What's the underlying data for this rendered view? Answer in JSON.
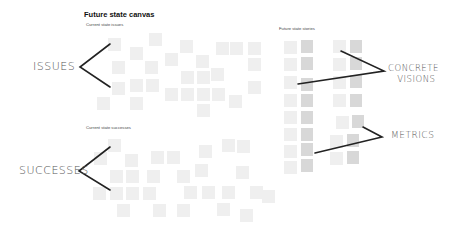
{
  "canvas": {
    "title": "Future state canvas",
    "sections": {
      "issues": {
        "label": "Current state issues"
      },
      "successes": {
        "label": "Current state successes"
      },
      "stories": {
        "label": "Future state stories"
      }
    },
    "annotations": {
      "issues": "ISSUES",
      "successes": "SUCCESSES",
      "concrete_visions_line1": "CONCRETE",
      "concrete_visions_line2": "VISIONS",
      "metrics": "METRICS"
    },
    "colors": {
      "note": "#efefef",
      "block": "#d8d8d8",
      "arrow": "#222222",
      "annotation_text": "#555555"
    }
  }
}
